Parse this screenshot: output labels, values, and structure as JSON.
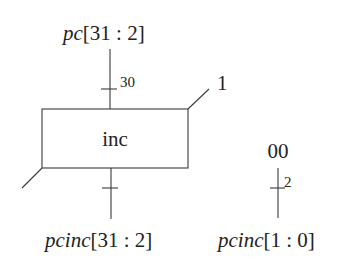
{
  "diagram": {
    "block": {
      "label": "inc"
    },
    "input_signal": {
      "name": "pc",
      "range": "[31 : 2]",
      "bus_width": "30"
    },
    "carry_in": {
      "value": "1"
    },
    "output_signal": {
      "name": "pcinc",
      "range": "[31 : 2]"
    },
    "constant": {
      "value": "00",
      "bus_width": "2"
    },
    "low_bits_signal": {
      "name": "pcinc",
      "range": "[1 : 0]"
    }
  },
  "colors": {
    "stroke": "#3a3a3a",
    "text": "#222222",
    "background": "#ffffff"
  }
}
